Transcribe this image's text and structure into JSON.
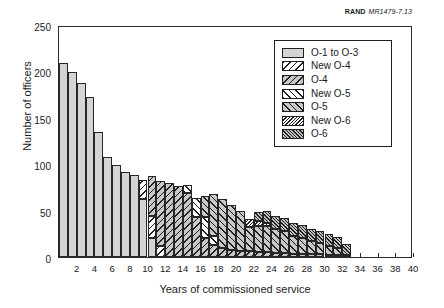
{
  "credit": {
    "org": "RAND",
    "figure_id": "MR1479-7.13"
  },
  "axes": {
    "ylabel": "Number of officers",
    "xlabel": "Years of commissioned service",
    "yticks": [
      "0",
      "50",
      "100",
      "150",
      "200",
      "250"
    ],
    "xticks": [
      "2",
      "4",
      "6",
      "8",
      "10",
      "12",
      "14",
      "16",
      "18",
      "20",
      "22",
      "24",
      "26",
      "28",
      "30",
      "32",
      "34",
      "36",
      "38",
      "40"
    ]
  },
  "legend": {
    "items": [
      {
        "label": "O-1 to O-3",
        "pattern": "p-o13",
        "color": "#d4d4d4"
      },
      {
        "label": "New O-4",
        "pattern": "p-newo4",
        "color": "#ffffff"
      },
      {
        "label": "O-4",
        "pattern": "p-o4",
        "color": "#c8c8c8"
      },
      {
        "label": "New O-5",
        "pattern": "p-newo5",
        "color": "#ffffff"
      },
      {
        "label": "O-5",
        "pattern": "p-o5",
        "color": "#c8c8c8"
      },
      {
        "label": "New O-6",
        "pattern": "p-newo6",
        "color": "#ffffff"
      },
      {
        "label": "O-6",
        "pattern": "p-o6",
        "color": "#c2c2c2"
      }
    ]
  },
  "chart_data": {
    "type": "bar",
    "subtype": "stacked",
    "title": "",
    "xlabel": "Years of commissioned service",
    "ylabel": "Number of officers",
    "xlim": [
      0,
      40
    ],
    "ylim": [
      0,
      250
    ],
    "ytick_step": 50,
    "xtick_step": 2,
    "grid": false,
    "legend_position": "upper-right-inset",
    "categories": [
      1,
      2,
      3,
      4,
      5,
      6,
      7,
      8,
      9,
      10,
      11,
      12,
      13,
      14,
      15,
      16,
      17,
      18,
      19,
      20,
      21,
      22,
      23,
      24,
      25,
      26,
      27,
      28,
      29,
      30,
      31,
      32,
      33
    ],
    "series": [
      {
        "name": "O-1 to O-3",
        "values": [
          209,
          199,
          188,
          172,
          135,
          108,
          99,
          92,
          88,
          62,
          20,
          0,
          0,
          0,
          0,
          0,
          0,
          0,
          0,
          0,
          0,
          0,
          0,
          0,
          0,
          0,
          0,
          0,
          0,
          0,
          0,
          0,
          0
        ]
      },
      {
        "name": "New O-4",
        "values": [
          0,
          0,
          0,
          0,
          0,
          0,
          0,
          0,
          0,
          21,
          24,
          12,
          0,
          0,
          0,
          0,
          0,
          0,
          0,
          0,
          0,
          0,
          0,
          0,
          0,
          0,
          0,
          0,
          0,
          0,
          0,
          0,
          0
        ]
      },
      {
        "name": "O-4",
        "values": [
          0,
          0,
          0,
          0,
          0,
          0,
          0,
          0,
          0,
          0,
          43,
          70,
          80,
          76,
          69,
          43,
          21,
          13,
          10,
          8,
          7,
          6,
          5,
          5,
          4,
          4,
          3,
          3,
          3,
          3,
          2,
          2,
          2
        ]
      },
      {
        "name": "New O-5",
        "values": [
          0,
          0,
          0,
          0,
          0,
          0,
          0,
          0,
          0,
          0,
          0,
          0,
          0,
          0,
          9,
          21,
          22,
          10,
          0,
          0,
          0,
          0,
          0,
          0,
          0,
          0,
          0,
          0,
          0,
          0,
          0,
          0,
          0
        ]
      },
      {
        "name": "O-5",
        "values": [
          0,
          0,
          0,
          0,
          0,
          0,
          0,
          0,
          0,
          0,
          0,
          0,
          0,
          0,
          0,
          0,
          23,
          45,
          52,
          48,
          43,
          26,
          28,
          28,
          26,
          24,
          20,
          18,
          14,
          12,
          10,
          8,
          0
        ]
      },
      {
        "name": "New O-6",
        "values": [
          0,
          0,
          0,
          0,
          0,
          0,
          0,
          0,
          0,
          0,
          0,
          0,
          0,
          0,
          0,
          0,
          0,
          0,
          0,
          0,
          0,
          9,
          6,
          4,
          0,
          0,
          0,
          0,
          0,
          0,
          0,
          0,
          0
        ]
      },
      {
        "name": "O-6",
        "values": [
          0,
          0,
          0,
          0,
          0,
          0,
          0,
          0,
          0,
          0,
          0,
          0,
          0,
          0,
          0,
          0,
          0,
          0,
          0,
          0,
          0,
          0,
          9,
          13,
          14,
          14,
          14,
          14,
          13,
          13,
          13,
          12,
          12
        ]
      }
    ],
    "totals": [
      209,
      199,
      188,
      172,
      135,
      108,
      99,
      92,
      88,
      83,
      87,
      82,
      80,
      76,
      78,
      64,
      66,
      68,
      62,
      56,
      50,
      41,
      42,
      50,
      44,
      42,
      37,
      35,
      30,
      28,
      25,
      22,
      14
    ]
  }
}
